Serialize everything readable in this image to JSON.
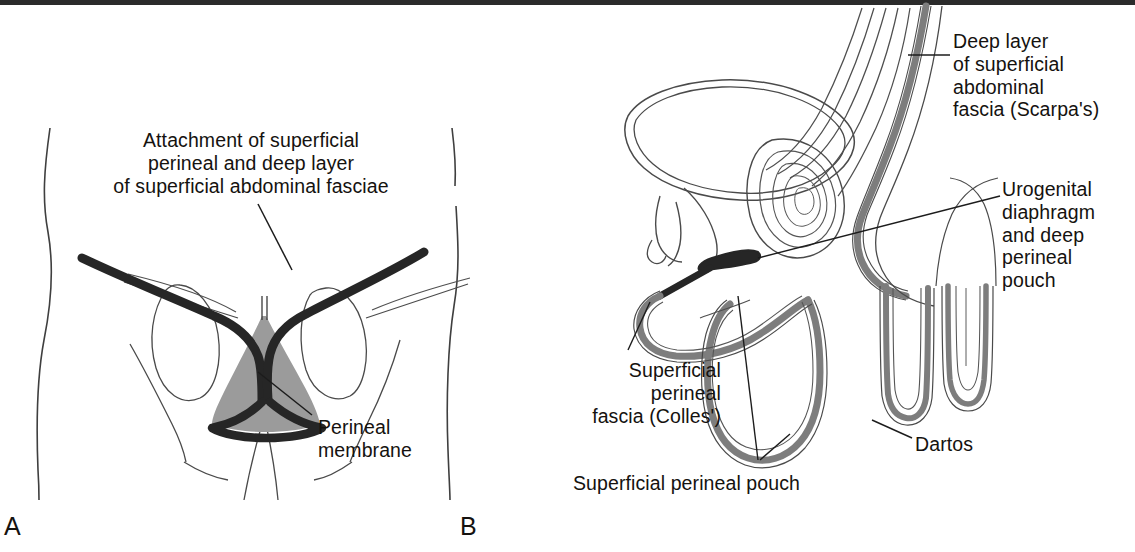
{
  "figure": {
    "background_color": "#ffffff"
  },
  "colors": {
    "ink": "#15120f",
    "line": "#3a3a3a",
    "thin_line": "#555555",
    "fascia_gray": "#7d7d7d",
    "membrane_fill": "#9b9b9b",
    "heavy_black": "#262626",
    "scan_bar": "#2b2b2b"
  },
  "panels": [
    {
      "letter": "A",
      "name": "anterior-perineum-view",
      "labels": [
        {
          "id": "attachment",
          "lines": [
            "Attachment of superficial",
            "perineal and deep layer",
            "of superficial abdominal fasciae"
          ],
          "align": "center"
        },
        {
          "id": "perineal-membrane",
          "lines": [
            "Perineal",
            "membrane"
          ],
          "align": "left"
        }
      ]
    },
    {
      "letter": "B",
      "name": "sagittal-section-view",
      "labels": [
        {
          "id": "deep-layer",
          "lines": [
            "Deep layer",
            "of superficial",
            "abdominal",
            "fascia (Scarpa's)"
          ],
          "align": "left"
        },
        {
          "id": "urogenital",
          "lines": [
            "Urogenital",
            "diaphragm",
            "and deep",
            "perineal",
            "pouch"
          ],
          "align": "left"
        },
        {
          "id": "colles",
          "lines": [
            "Superficial",
            "perineal",
            "fascia (Colles')"
          ],
          "align": "right"
        },
        {
          "id": "superficial-perineal-pouch",
          "lines": [
            "Superficial perineal pouch"
          ],
          "align": "left"
        },
        {
          "id": "dartos",
          "lines": [
            "Dartos"
          ],
          "align": "left"
        }
      ]
    }
  ],
  "label_text": {
    "attachment": "Attachment of superficial\nperineal and deep layer\nof superficial abdominal fasciae",
    "perineal_membrane": "Perineal\nmembrane",
    "deep_layer": "Deep layer\nof superficial\nabdominal\nfascia (Scarpa's)",
    "urogenital": "Urogenital\ndiaphragm\nand deep\nperineal\npouch",
    "colles": "Superficial\nperineal\nfascia (Colles')",
    "superficial_perineal_pouch": "Superficial perineal pouch",
    "dartos": "Dartos",
    "letter_a": "A",
    "letter_b": "B"
  }
}
